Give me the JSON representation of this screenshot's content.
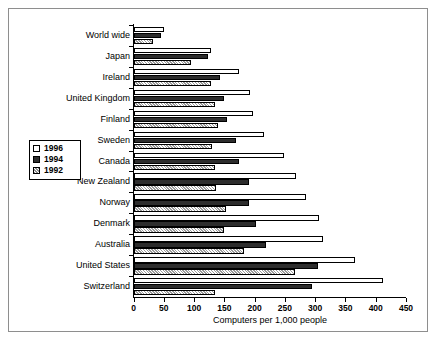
{
  "chart_data": {
    "type": "bar",
    "orientation": "horizontal",
    "title": "",
    "xlabel": "Computers per 1,000 people",
    "ylabel": "",
    "xlim": [
      0,
      450
    ],
    "xticks": [
      0,
      50,
      100,
      150,
      200,
      250,
      300,
      350,
      400,
      450
    ],
    "grid": false,
    "legend_position": "left-middle",
    "categories": [
      "World wide",
      "Japan",
      "Ireland",
      "United Kingdom",
      "Finland",
      "Sweden",
      "Canada",
      "New Zealand",
      "Norway",
      "Denmark",
      "Australia",
      "United States",
      "Switzerland"
    ],
    "series": [
      {
        "name": "1996",
        "color": "#ffffff",
        "pattern": "empty",
        "values": [
          50,
          128,
          175,
          193,
          197,
          215,
          248,
          268,
          285,
          307,
          313,
          365,
          412
        ]
      },
      {
        "name": "1994",
        "color": "#2d2d2d",
        "pattern": "solid-dark",
        "values": [
          45,
          123,
          143,
          150,
          155,
          170,
          175,
          190,
          190,
          203,
          218,
          305,
          295
        ]
      },
      {
        "name": "1992",
        "color": "#e2e2e2",
        "pattern": "hatched",
        "values": [
          33,
          95,
          128,
          135,
          140,
          130,
          135,
          137,
          153,
          150,
          182,
          267,
          135
        ]
      }
    ]
  },
  "legend": {
    "items": [
      {
        "label": "1996",
        "key": "y1996"
      },
      {
        "label": "1994",
        "key": "y1994"
      },
      {
        "label": "1992",
        "key": "y1992"
      }
    ]
  },
  "axis": {
    "x_title": "Computers per 1,000 people",
    "tick_labels": [
      "0",
      "50",
      "100",
      "150",
      "200",
      "250",
      "300",
      "350",
      "400",
      "450"
    ]
  }
}
